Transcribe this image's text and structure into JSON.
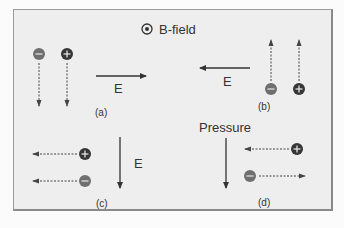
{
  "title": {
    "symbol": "dot-in-circle",
    "text": "B-field"
  },
  "colors": {
    "negative": "#6f6f6f",
    "positive": "#363636",
    "arrow": "#333333",
    "drift": "#444444",
    "background": "#eeeeee",
    "border": "#9a9a9a"
  },
  "panels": [
    {
      "id": "a",
      "label": "(a)",
      "field_label": "E",
      "field_direction": "right",
      "charges": [
        {
          "sign": "-",
          "symbol": "−",
          "drift": "down"
        },
        {
          "sign": "+",
          "symbol": "+",
          "drift": "down"
        }
      ]
    },
    {
      "id": "b",
      "label": "(b)",
      "field_label": "E",
      "field_direction": "left",
      "charges": [
        {
          "sign": "-",
          "symbol": "−",
          "drift": "up"
        },
        {
          "sign": "+",
          "symbol": "+",
          "drift": "up"
        }
      ]
    },
    {
      "id": "c",
      "label": "(c)",
      "field_label": "E",
      "field_direction": "down",
      "charges": [
        {
          "sign": "+",
          "symbol": "+",
          "drift": "left"
        },
        {
          "sign": "-",
          "symbol": "−",
          "drift": "left"
        }
      ]
    },
    {
      "id": "d",
      "label": "(d)",
      "field_label": "Pressure",
      "field_direction": "down",
      "charges": [
        {
          "sign": "+",
          "symbol": "+",
          "drift": "left"
        },
        {
          "sign": "-",
          "symbol": "−",
          "drift": "right"
        }
      ]
    }
  ]
}
